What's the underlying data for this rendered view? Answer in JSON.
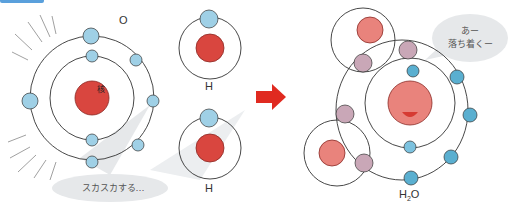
{
  "figure": {
    "left_atoms": {
      "oxygen": {
        "label": "O",
        "nucleus_text": "核",
        "electrons_inner": 2,
        "electrons_outer": 6
      },
      "hydrogen_top": {
        "label": "H",
        "nucleus_text": "核",
        "electrons": 1
      },
      "hydrogen_bottom": {
        "label": "H",
        "nucleus_text": "核",
        "electrons": 1
      },
      "speech": "スカスカする…"
    },
    "arrow": {
      "direction": "right",
      "color": "#e02a20"
    },
    "molecule": {
      "label": "H₂O",
      "label_main": "H",
      "label_sub": "2",
      "label_end": "O",
      "nucleus_text": "核",
      "speech_line1": "あー",
      "speech_line2": "落ち着くー"
    },
    "colors": {
      "nucleus": "#d9463f",
      "nucleus_light": "#e9837c",
      "electron": "#9fd0e6",
      "electron_dark": "#5aafd0",
      "shared_electron": "#c9a7b7",
      "bubble": "#e6e8ea"
    }
  }
}
